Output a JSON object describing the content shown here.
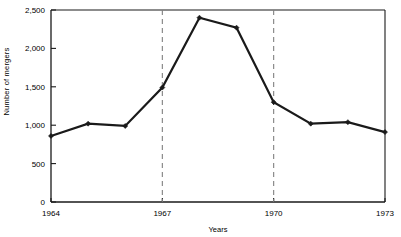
{
  "chart_data": {
    "type": "line",
    "title": "",
    "subtitle": "",
    "xlabel": "Years",
    "ylabel": "Number of mergers",
    "x": [
      1964,
      1965,
      1966,
      1967,
      1968,
      1969,
      1970,
      1971,
      1972,
      1973
    ],
    "values": [
      860,
      1020,
      990,
      1490,
      2400,
      2270,
      1300,
      1020,
      1040,
      910
    ],
    "series": [
      {
        "name": "Number of mergers",
        "values": [
          860,
          1020,
          990,
          1490,
          2400,
          2270,
          1300,
          1020,
          1040,
          910
        ]
      }
    ],
    "xlim": [
      1964,
      1973
    ],
    "ylim": [
      0,
      2500
    ],
    "ytick_values": [
      0,
      500,
      1000,
      1500,
      2000,
      2500
    ],
    "ytick_labels": [
      "0",
      "500",
      "1,000",
      "1,500",
      "2,000",
      "2,500"
    ],
    "xtick_values": [
      1964,
      1967,
      1970,
      1973
    ],
    "xtick_labels": [
      "1964",
      "1967",
      "1970",
      "1973"
    ],
    "grid": false,
    "legend": "none",
    "annotations": [
      {
        "name": "vertical-dashed-line",
        "x": 1967,
        "style": "dashed",
        "color": "#808080"
      },
      {
        "name": "vertical-dashed-line",
        "x": 1970,
        "style": "dashed",
        "color": "#808080"
      }
    ],
    "colors": {
      "line": "#1a1a1a",
      "marker": "#1a1a1a",
      "axis": "#1a1a1a",
      "dashed_reference": "#8c8c8c",
      "background": "#ffffff"
    },
    "marker": "diamond",
    "line_width": 2.2
  }
}
